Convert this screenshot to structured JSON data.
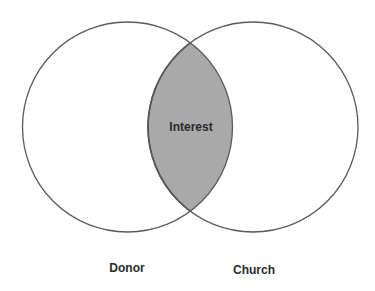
{
  "diagram": {
    "type": "venn",
    "sets": [
      {
        "label": "Donor",
        "cx": 127.5,
        "cy": 127,
        "r": 105
      },
      {
        "label": "Church",
        "cx": 253,
        "cy": 127,
        "r": 105
      }
    ],
    "intersection": {
      "label": "Interest"
    },
    "colors": {
      "stroke": "#5a5a5a",
      "intersection_fill": "#a9a9a9",
      "intersection_stroke": "#3a3a3a",
      "background": "#ffffff",
      "text": "#2a2a2a"
    }
  },
  "labels": {
    "intersection": "Interest",
    "left": "Donor",
    "right": "Church"
  }
}
